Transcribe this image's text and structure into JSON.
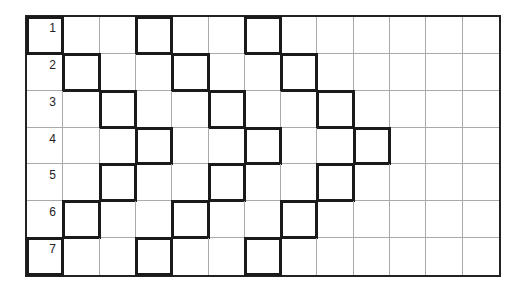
{
  "grid": {
    "rows": 7,
    "cols": 13,
    "row_labels": [
      "1",
      "2",
      "3",
      "4",
      "5",
      "6",
      "7"
    ],
    "highlighted": [
      [
        0,
        3,
        6
      ],
      [
        1,
        4,
        7
      ],
      [
        2,
        5,
        8
      ],
      [
        3,
        6,
        9
      ],
      [
        2,
        5,
        8
      ],
      [
        1,
        4,
        7
      ],
      [
        0,
        3,
        6
      ]
    ],
    "line_color": "#aaaaaa",
    "highlight_color": "#1a1a1a"
  }
}
